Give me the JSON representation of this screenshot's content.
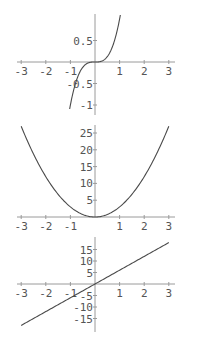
{
  "chart_data": [
    {
      "type": "line",
      "title": "",
      "function": "x^3",
      "xlabel": "",
      "ylabel": "",
      "xlim": [
        -3,
        3
      ],
      "ylim": [
        -1.1,
        1.1
      ],
      "x_ticks": [
        "-3",
        "-2",
        "-1",
        "1",
        "2",
        "3"
      ],
      "y_ticks": [
        "0.5",
        "-0.5",
        "-1"
      ],
      "series": [
        {
          "name": "x^3",
          "x": [
            -1.03,
            -0.75,
            -0.5,
            -0.25,
            0,
            0.25,
            0.5,
            0.75,
            1.03
          ],
          "y": [
            -1.09,
            -0.42,
            -0.125,
            -0.016,
            0,
            0.016,
            0.125,
            0.42,
            1.09
          ]
        }
      ],
      "grid": false
    },
    {
      "type": "line",
      "title": "",
      "function": "3x^2",
      "xlabel": "",
      "ylabel": "",
      "xlim": [
        -3,
        3
      ],
      "ylim": [
        0,
        27
      ],
      "x_ticks": [
        "-3",
        "-2",
        "-1",
        "1",
        "2",
        "3"
      ],
      "y_ticks": [
        "25",
        "20",
        "15",
        "10",
        "5"
      ],
      "series": [
        {
          "name": "3x^2",
          "x": [
            -3,
            -2,
            -1,
            0,
            1,
            2,
            3
          ],
          "y": [
            27,
            12,
            3,
            0,
            3,
            12,
            27
          ]
        }
      ],
      "grid": false
    },
    {
      "type": "line",
      "title": "",
      "function": "6x",
      "xlabel": "",
      "ylabel": "",
      "xlim": [
        -3,
        3
      ],
      "ylim": [
        -18,
        18
      ],
      "x_ticks": [
        "-3",
        "-2",
        "-1",
        "1",
        "2",
        "3"
      ],
      "y_ticks": [
        "15",
        "10",
        "5",
        "-5",
        "-10",
        "-15"
      ],
      "series": [
        {
          "name": "6x",
          "x": [
            -3,
            0,
            3
          ],
          "y": [
            -18,
            0,
            18
          ]
        }
      ],
      "grid": false
    }
  ]
}
